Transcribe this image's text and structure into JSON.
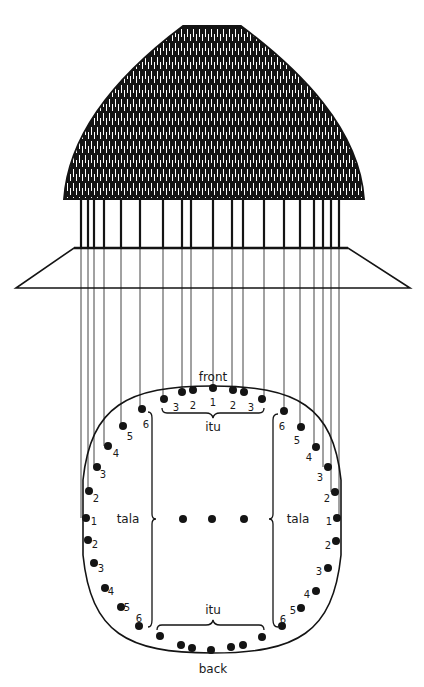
{
  "diagram": {
    "colors": {
      "ink": "#141414",
      "thatch_light": "#ffffff",
      "background": "#ffffff"
    },
    "roof": {
      "label": "thatched-roof",
      "top_y": 26,
      "top_x1": 183,
      "top_x2": 241,
      "base_y": 199,
      "base_x1": 64,
      "base_x2": 364
    },
    "posts": {
      "top_y": 199,
      "bottom_y": 248,
      "x": [
        81,
        88,
        94,
        104,
        121,
        140,
        163,
        182,
        191,
        213,
        232,
        243,
        264,
        284,
        300,
        314,
        323,
        331,
        339
      ]
    },
    "platform": {
      "top_y": 248,
      "top_x1": 74,
      "top_x2": 348,
      "bottom_y": 288,
      "bottom_x1": 16,
      "bottom_x2": 410
    },
    "floor_plan": {
      "outline": {
        "left_x": 83,
        "right_x": 341,
        "top_y": 386,
        "bottom_y": 653,
        "upper_arc_end_y": 480,
        "lower_arc_start_y": 555
      },
      "labels": {
        "front": "front",
        "back": "back",
        "itu_top": "itu",
        "itu_bottom": "itu",
        "tala_left": "tala",
        "tala_right": "tala"
      },
      "front_posts": [
        {
          "x": 164,
          "y": 399,
          "num": "3"
        },
        {
          "x": 182,
          "y": 392,
          "num": "2"
        },
        {
          "x": 193,
          "y": 390,
          "num": ""
        },
        {
          "x": 213,
          "y": 388,
          "num": "1"
        },
        {
          "x": 233,
          "y": 390,
          "num": ""
        },
        {
          "x": 244,
          "y": 392,
          "num": "2"
        },
        {
          "x": 262,
          "y": 399,
          "num": "3"
        }
      ],
      "front_numbers": [
        {
          "x": 176,
          "y": 408,
          "t": "3"
        },
        {
          "x": 193,
          "y": 406,
          "t": "2"
        },
        {
          "x": 213,
          "y": 403,
          "t": "1"
        },
        {
          "x": 233,
          "y": 406,
          "t": "2"
        },
        {
          "x": 251,
          "y": 408,
          "t": "3"
        }
      ],
      "left_posts": [
        {
          "x": 142,
          "y": 409,
          "num": "6",
          "nx": 146,
          "ny": 425
        },
        {
          "x": 123,
          "y": 426,
          "num": "5",
          "nx": 130,
          "ny": 437
        },
        {
          "x": 108,
          "y": 446,
          "num": "4",
          "nx": 116,
          "ny": 454
        },
        {
          "x": 97,
          "y": 467,
          "num": "3",
          "nx": 103,
          "ny": 475
        },
        {
          "x": 89,
          "y": 491,
          "num": "2",
          "nx": 96,
          "ny": 499
        },
        {
          "x": 86,
          "y": 518,
          "num": "1",
          "nx": 94,
          "ny": 522
        },
        {
          "x": 88,
          "y": 540,
          "num": "2",
          "nx": 95,
          "ny": 545
        },
        {
          "x": 94,
          "y": 563,
          "num": "3",
          "nx": 101,
          "ny": 569
        },
        {
          "x": 105,
          "y": 588,
          "num": "4",
          "nx": 111,
          "ny": 592
        },
        {
          "x": 121,
          "y": 607,
          "num": "5",
          "nx": 127,
          "ny": 608
        },
        {
          "x": 139,
          "y": 626,
          "num": "6",
          "nx": 139,
          "ny": 619
        }
      ],
      "right_posts": [
        {
          "x": 284,
          "y": 411,
          "num": "6",
          "nx": 282,
          "ny": 427
        },
        {
          "x": 301,
          "y": 427,
          "num": "5",
          "nx": 297,
          "ny": 441
        },
        {
          "x": 316,
          "y": 447,
          "num": "4",
          "nx": 309,
          "ny": 458
        },
        {
          "x": 328,
          "y": 467,
          "num": "3",
          "nx": 320,
          "ny": 478
        },
        {
          "x": 335,
          "y": 492,
          "num": "2",
          "nx": 327,
          "ny": 499
        },
        {
          "x": 337,
          "y": 518,
          "num": "1",
          "nx": 329,
          "ny": 522
        },
        {
          "x": 336,
          "y": 541,
          "num": "2",
          "nx": 328,
          "ny": 546
        },
        {
          "x": 328,
          "y": 568,
          "num": "3",
          "nx": 319,
          "ny": 572
        },
        {
          "x": 316,
          "y": 591,
          "num": "4",
          "nx": 307,
          "ny": 595
        },
        {
          "x": 301,
          "y": 608,
          "num": "5",
          "nx": 293,
          "ny": 611
        },
        {
          "x": 282,
          "y": 626,
          "num": "6",
          "nx": 283,
          "ny": 620
        }
      ],
      "back_posts": [
        {
          "x": 160,
          "y": 636
        },
        {
          "x": 181,
          "y": 645
        },
        {
          "x": 192,
          "y": 648
        },
        {
          "x": 211,
          "y": 650
        },
        {
          "x": 231,
          "y": 647
        },
        {
          "x": 243,
          "y": 645
        },
        {
          "x": 262,
          "y": 637
        }
      ],
      "center_posts": [
        {
          "x": 183,
          "y": 519
        },
        {
          "x": 212,
          "y": 519
        },
        {
          "x": 244,
          "y": 519
        }
      ],
      "text_positions": {
        "front": {
          "x": 213,
          "y": 381
        },
        "back": {
          "x": 213,
          "y": 673
        },
        "itu_top": {
          "x": 213,
          "y": 431
        },
        "itu_bottom": {
          "x": 213,
          "y": 614
        },
        "tala_left": {
          "x": 128,
          "y": 523
        },
        "tala_right": {
          "x": 298,
          "y": 523
        }
      }
    },
    "post_to_plan_lines": [
      [
        81,
        518
      ],
      [
        88,
        491
      ],
      [
        94,
        467
      ],
      [
        104,
        446
      ],
      [
        121,
        426
      ],
      [
        140,
        409
      ],
      [
        163,
        399
      ],
      [
        182,
        392
      ],
      [
        191,
        390
      ],
      [
        213,
        388
      ],
      [
        232,
        390
      ],
      [
        243,
        392
      ],
      [
        264,
        399
      ],
      [
        284,
        411
      ],
      [
        300,
        427
      ],
      [
        314,
        447
      ],
      [
        323,
        467
      ],
      [
        331,
        492
      ],
      [
        339,
        518
      ]
    ]
  }
}
